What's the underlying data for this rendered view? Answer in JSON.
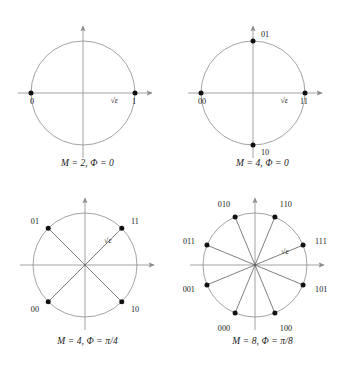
{
  "figure": {
    "amplitude_label": "√ε",
    "colors": {
      "axis": "#8c8c8c",
      "circle": "#8c8c8c",
      "spoke": "#555555",
      "point": "#111111",
      "text": "#1a1a1a",
      "background": "#ffffff"
    }
  },
  "panels": [
    {
      "id": "panel-bpsk",
      "caption": "M = 2, Φ = 0",
      "caption_parts": {
        "m_symbol": "M",
        "m_value": "2",
        "phi_symbol": "Φ",
        "phi_value": "0"
      },
      "M": 2,
      "phase_offset_rad": 0,
      "show_spokes": false,
      "amplitude_label": "√ε",
      "points": [
        {
          "label": "1",
          "angle_deg": 0,
          "label_pos": "right-below"
        },
        {
          "label": "0",
          "angle_deg": 180,
          "label_pos": "left-below"
        }
      ]
    },
    {
      "id": "panel-qpsk-0",
      "caption": "M = 4, Φ = 0",
      "caption_parts": {
        "m_symbol": "M",
        "m_value": "4",
        "phi_symbol": "Φ",
        "phi_value": "0"
      },
      "M": 4,
      "phase_offset_rad": 0,
      "show_spokes": false,
      "amplitude_label": "√ε",
      "points": [
        {
          "label": "11",
          "angle_deg": 0,
          "label_pos": "right-below"
        },
        {
          "label": "01",
          "angle_deg": 90,
          "label_pos": "top-right"
        },
        {
          "label": "00",
          "angle_deg": 180,
          "label_pos": "left-below"
        },
        {
          "label": "10",
          "angle_deg": 270,
          "label_pos": "bottom-right"
        }
      ]
    },
    {
      "id": "panel-qpsk-pi4",
      "caption": "M = 4, Φ = π/4",
      "caption_parts": {
        "m_symbol": "M",
        "m_value": "4",
        "phi_symbol": "Φ",
        "phi_value": "π/4"
      },
      "M": 4,
      "phase_offset_rad": 0.7853981634,
      "show_spokes": true,
      "amplitude_label": "√ε",
      "points": [
        {
          "label": "11",
          "angle_deg": 45,
          "label_pos": "upper-right"
        },
        {
          "label": "01",
          "angle_deg": 135,
          "label_pos": "upper-left"
        },
        {
          "label": "00",
          "angle_deg": 225,
          "label_pos": "lower-left"
        },
        {
          "label": "10",
          "angle_deg": 315,
          "label_pos": "lower-right"
        }
      ]
    },
    {
      "id": "panel-8psk-pi8",
      "caption": "M = 8, Φ = π/8",
      "caption_parts": {
        "m_symbol": "M",
        "m_value": "8",
        "phi_symbol": "Φ",
        "phi_value": "π/8"
      },
      "M": 8,
      "phase_offset_rad": 0.3926990817,
      "show_spokes": true,
      "amplitude_label": "√ε",
      "points": [
        {
          "label": "111",
          "angle_deg": 22.5,
          "label_pos": "right"
        },
        {
          "label": "110",
          "angle_deg": 67.5,
          "label_pos": "upper-right"
        },
        {
          "label": "010",
          "angle_deg": 112.5,
          "label_pos": "upper-left"
        },
        {
          "label": "011",
          "angle_deg": 157.5,
          "label_pos": "left"
        },
        {
          "label": "001",
          "angle_deg": 202.5,
          "label_pos": "left"
        },
        {
          "label": "000",
          "angle_deg": 247.5,
          "label_pos": "lower-left"
        },
        {
          "label": "100",
          "angle_deg": 292.5,
          "label_pos": "lower-right"
        },
        {
          "label": "101",
          "angle_deg": 337.5,
          "label_pos": "right"
        }
      ]
    }
  ],
  "chart_data": {
    "type": "scatter",
    "xlabel": "",
    "ylabel": "",
    "grid": false,
    "legend": "none",
    "subplots": [
      {
        "name": "M = 2, Φ = 0",
        "M": 2,
        "phase_offset_rad": 0,
        "radius_label": "√ε",
        "x": [
          1,
          -1
        ],
        "y": [
          0,
          0
        ],
        "point_labels": [
          "1",
          "0"
        ],
        "angles_deg": [
          0,
          180
        ]
      },
      {
        "name": "M = 4, Φ = 0",
        "M": 4,
        "phase_offset_rad": 0,
        "radius_label": "√ε",
        "x": [
          1,
          0,
          -1,
          0
        ],
        "y": [
          0,
          1,
          0,
          -1
        ],
        "point_labels": [
          "11",
          "01",
          "00",
          "10"
        ],
        "angles_deg": [
          0,
          90,
          180,
          270
        ]
      },
      {
        "name": "M = 4, Φ = π/4",
        "M": 4,
        "phase_offset_rad": 0.7853981634,
        "radius_label": "√ε",
        "x": [
          0.7071,
          -0.7071,
          -0.7071,
          0.7071
        ],
        "y": [
          0.7071,
          0.7071,
          -0.7071,
          -0.7071
        ],
        "point_labels": [
          "11",
          "01",
          "00",
          "10"
        ],
        "angles_deg": [
          45,
          135,
          225,
          315
        ]
      },
      {
        "name": "M = 8, Φ = π/8",
        "M": 8,
        "phase_offset_rad": 0.3926990817,
        "radius_label": "√ε",
        "x": [
          0.9239,
          0.3827,
          -0.3827,
          -0.9239,
          -0.9239,
          -0.3827,
          0.3827,
          0.9239
        ],
        "y": [
          0.3827,
          0.9239,
          0.9239,
          0.3827,
          -0.3827,
          -0.9239,
          -0.9239,
          -0.3827
        ],
        "point_labels": [
          "111",
          "110",
          "010",
          "011",
          "001",
          "000",
          "100",
          "101"
        ],
        "angles_deg": [
          22.5,
          67.5,
          112.5,
          157.5,
          202.5,
          247.5,
          292.5,
          337.5
        ]
      }
    ]
  }
}
